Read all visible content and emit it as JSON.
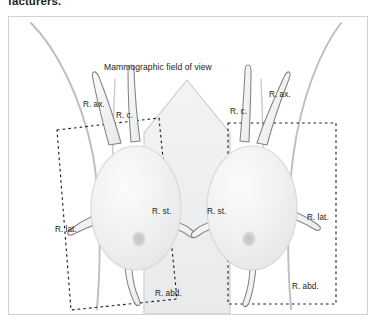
{
  "page": {
    "clipped_text_above_figure": "facturers."
  },
  "figure": {
    "title": "Mammographic field of view",
    "labels": {
      "left": {
        "axilla": "R. ax.",
        "central": "R. c.",
        "lateral": "R. lat.",
        "sternal": "R. st.",
        "abdominal": "R. abd."
      },
      "right": {
        "axilla": "R. ax.",
        "central": "R. c.",
        "lateral": "R. lat.",
        "sternal": "R. st.",
        "abdominal": "R. abd."
      }
    },
    "colors": {
      "outline": "#6d6e71",
      "body_contour": "#bcbec0",
      "breast_fill": "#f1f2f2",
      "field_fill": "#eeeeef",
      "field_stroke": "#c9cacc",
      "nipple": "#c7c8ca",
      "dashed_box": "#231f20",
      "frame_border": "#d2d2d2",
      "text": "#231f20"
    },
    "shapes": {
      "field_of_view": "pentagon",
      "left_roi_box": "rotated-dashed-rectangle",
      "right_roi_box": "upright-dashed-rectangle",
      "breasts": 2,
      "projections_per_breast": 5
    }
  }
}
